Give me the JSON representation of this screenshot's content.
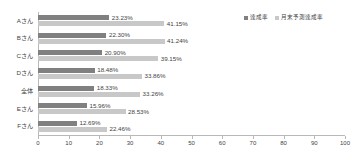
{
  "chart_data": {
    "type": "bar",
    "orientation": "horizontal",
    "title": "",
    "xlabel": "",
    "ylabel": "",
    "xlim": [
      0,
      100
    ],
    "xticks": [
      0,
      10,
      20,
      30,
      40,
      50,
      60,
      70,
      80,
      90,
      100
    ],
    "grid": false,
    "legend_position": "top-right",
    "categories": [
      "Aさん",
      "Bさん",
      "Cさん",
      "Dさん",
      "全体",
      "Eさん",
      "Fさん"
    ],
    "series": [
      {
        "name": "達成率",
        "color": "#808080",
        "values": [
          23.23,
          22.3,
          20.9,
          18.48,
          18.33,
          15.96,
          12.69
        ],
        "labels": [
          "23.23%",
          "22.30%",
          "20.90%",
          "18.48%",
          "18.33%",
          "15.96%",
          "12.69%"
        ]
      },
      {
        "name": "月末予測達成率",
        "color": "#c8c8c8",
        "values": [
          41.15,
          41.24,
          39.15,
          33.86,
          33.26,
          28.53,
          22.46
        ],
        "labels": [
          "41.15%",
          "41.24%",
          "39.15%",
          "33.86%",
          "33.26%",
          "28.53%",
          "22.46%"
        ]
      }
    ]
  },
  "legend": {
    "entries": [
      {
        "label": "達成率",
        "color": "#808080"
      },
      {
        "label": "月末予測達成率",
        "color": "#c8c8c8"
      }
    ]
  },
  "axis": {
    "tick_labels": [
      "0",
      "10",
      "20",
      "30",
      "40",
      "50",
      "60",
      "70",
      "80",
      "90",
      "100"
    ]
  }
}
